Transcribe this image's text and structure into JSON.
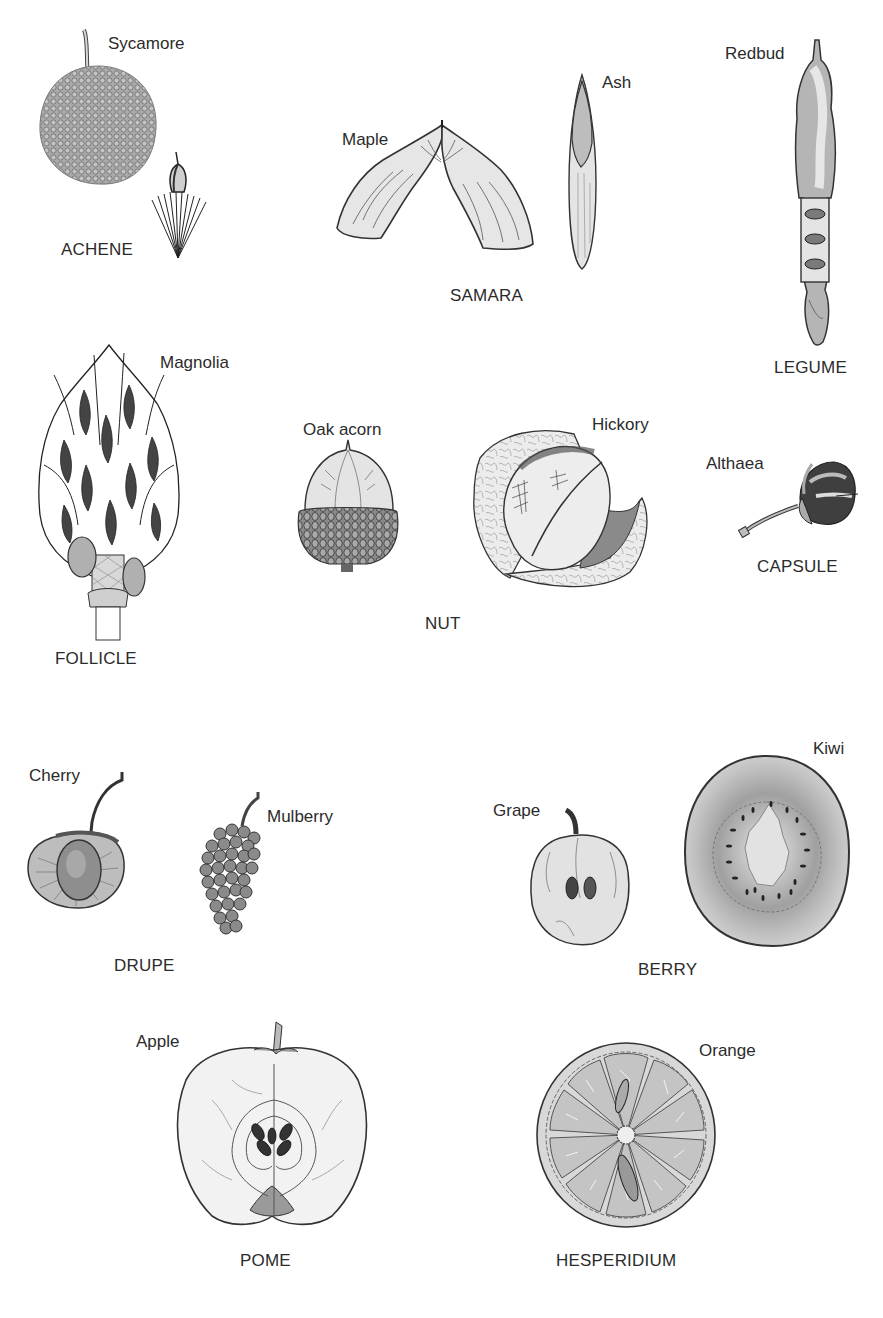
{
  "diagram": {
    "title": "",
    "style": "grayscale botanical line illustration",
    "colors": {
      "background": "#ffffff",
      "text": "#2b2b2b",
      "ink": "#333333",
      "fill_light": "#e6e6e6",
      "fill_mid": "#b5b5b5",
      "fill_dark": "#555555"
    },
    "groups": [
      {
        "id": "achene",
        "category": "ACHENE",
        "examples": [
          "Sycamore"
        ]
      },
      {
        "id": "samara",
        "category": "SAMARA",
        "examples": [
          "Maple",
          "Ash"
        ]
      },
      {
        "id": "legume",
        "category": "LEGUME",
        "examples": [
          "Redbud"
        ]
      },
      {
        "id": "follicle",
        "category": "FOLLICLE",
        "examples": [
          "Magnolia"
        ]
      },
      {
        "id": "nut",
        "category": "NUT",
        "examples": [
          "Oak acorn",
          "Hickory"
        ]
      },
      {
        "id": "capsule",
        "category": "CAPSULE",
        "examples": [
          "Althaea"
        ]
      },
      {
        "id": "drupe",
        "category": "DRUPE",
        "examples": [
          "Cherry",
          "Mulberry"
        ]
      },
      {
        "id": "berry",
        "category": "BERRY",
        "examples": [
          "Grape",
          "Kiwi"
        ]
      },
      {
        "id": "pome",
        "category": "POME",
        "examples": [
          "Apple"
        ]
      },
      {
        "id": "hesperidium",
        "category": "HESPERIDIUM",
        "examples": [
          "Orange"
        ]
      }
    ]
  }
}
